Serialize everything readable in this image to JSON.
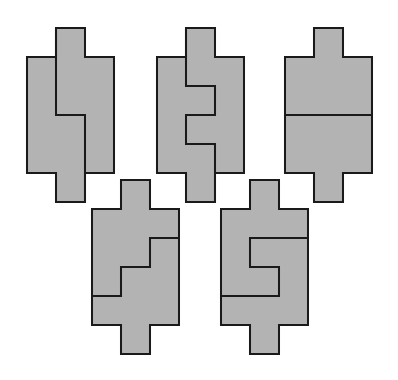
{
  "figure": {
    "fill": "#b3b3b3",
    "stroke": "#1a1a1a",
    "unit": 29,
    "shapes": [
      {
        "id": "shape-1",
        "ox": 27,
        "oy": 28
      },
      {
        "id": "shape-2",
        "ox": 157,
        "oy": 28
      },
      {
        "id": "shape-3",
        "ox": 285,
        "oy": 28
      },
      {
        "id": "shape-4",
        "ox": 92,
        "oy": 180
      },
      {
        "id": "shape-5",
        "ox": 221,
        "oy": 180
      }
    ]
  }
}
